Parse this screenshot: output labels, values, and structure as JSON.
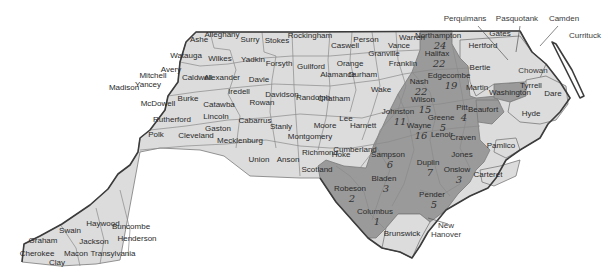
{
  "map": {
    "title": "North Carolina counties",
    "colors": {
      "light_fill": "#dcdcdc",
      "dark_fill": "#9a9a9a",
      "border": "#7a7a7a",
      "state_outline": "#3c3c3c",
      "background": "#ffffff"
    },
    "counties": [
      {
        "name": "Cherokee",
        "x": 37,
        "y": 256,
        "shade": "light"
      },
      {
        "name": "Clay",
        "x": 57,
        "y": 265,
        "shade": "light"
      },
      {
        "name": "Graham",
        "x": 43,
        "y": 243,
        "shade": "light"
      },
      {
        "name": "Swain",
        "x": 70,
        "y": 233,
        "shade": "light"
      },
      {
        "name": "Macon",
        "x": 76,
        "y": 256,
        "shade": "light"
      },
      {
        "name": "Jackson",
        "x": 94,
        "y": 244,
        "shade": "light"
      },
      {
        "name": "Haywood",
        "x": 103,
        "y": 226,
        "shade": "light"
      },
      {
        "name": "Transylvania",
        "x": 113,
        "y": 256,
        "shade": "light"
      },
      {
        "name": "Buncombe",
        "x": 131,
        "y": 229,
        "shade": "light"
      },
      {
        "name": "Henderson",
        "x": 137,
        "y": 241,
        "shade": "light"
      },
      {
        "name": "Madison",
        "x": 124,
        "y": 90,
        "shade": "light"
      },
      {
        "name": "Yancey",
        "x": 148,
        "y": 87,
        "shade": "light"
      },
      {
        "name": "Mitchell",
        "x": 153,
        "y": 78,
        "shade": "light"
      },
      {
        "name": "Avery",
        "x": 171,
        "y": 72,
        "shade": "light"
      },
      {
        "name": "McDowell",
        "x": 158,
        "y": 106,
        "shade": "light"
      },
      {
        "name": "Rutherford",
        "x": 172,
        "y": 122,
        "shade": "light"
      },
      {
        "name": "Polk",
        "x": 156,
        "y": 137,
        "shade": "light"
      },
      {
        "name": "Ashe",
        "x": 199,
        "y": 42,
        "shade": "light"
      },
      {
        "name": "Alleghany",
        "x": 222,
        "y": 37,
        "shade": "light"
      },
      {
        "name": "Watauga",
        "x": 186,
        "y": 58,
        "shade": "light"
      },
      {
        "name": "Caldwell",
        "x": 197,
        "y": 80,
        "shade": "light"
      },
      {
        "name": "Burke",
        "x": 188,
        "y": 101,
        "shade": "light"
      },
      {
        "name": "Cleveland",
        "x": 196,
        "y": 138,
        "shade": "light"
      },
      {
        "name": "Surry",
        "x": 250,
        "y": 42,
        "shade": "light"
      },
      {
        "name": "Wilkes",
        "x": 220,
        "y": 61,
        "shade": "light"
      },
      {
        "name": "Alexander",
        "x": 222,
        "y": 80,
        "shade": "light"
      },
      {
        "name": "Catawba",
        "x": 219,
        "y": 107,
        "shade": "light"
      },
      {
        "name": "Lincoln",
        "x": 216,
        "y": 119,
        "shade": "light"
      },
      {
        "name": "Gaston",
        "x": 218,
        "y": 131,
        "shade": "light"
      },
      {
        "name": "Iredell",
        "x": 239,
        "y": 94,
        "shade": "light"
      },
      {
        "name": "Yadkin",
        "x": 253,
        "y": 62,
        "shade": "light"
      },
      {
        "name": "Davie",
        "x": 259,
        "y": 82,
        "shade": "light"
      },
      {
        "name": "Rowan",
        "x": 262,
        "y": 105,
        "shade": "light"
      },
      {
        "name": "Mecklenburg",
        "x": 240,
        "y": 143,
        "shade": "light"
      },
      {
        "name": "Cabarrus",
        "x": 255,
        "y": 123,
        "shade": "light"
      },
      {
        "name": "Stanly",
        "x": 281,
        "y": 129,
        "shade": "light"
      },
      {
        "name": "Union",
        "x": 259,
        "y": 162,
        "shade": "light"
      },
      {
        "name": "Anson",
        "x": 288,
        "y": 162,
        "shade": "light"
      },
      {
        "name": "Stokes",
        "x": 277,
        "y": 43,
        "shade": "light"
      },
      {
        "name": "Forsyth",
        "x": 279,
        "y": 66,
        "shade": "light"
      },
      {
        "name": "Davidson",
        "x": 282,
        "y": 97,
        "shade": "light"
      },
      {
        "name": "Montgomery",
        "x": 310,
        "y": 139,
        "shade": "light"
      },
      {
        "name": "Richmond",
        "x": 320,
        "y": 155,
        "shade": "light"
      },
      {
        "name": "Rockingham",
        "x": 310,
        "y": 38,
        "shade": "light"
      },
      {
        "name": "Guilford",
        "x": 311,
        "y": 69,
        "shade": "light"
      },
      {
        "name": "Randolph",
        "x": 313,
        "y": 100,
        "shade": "light"
      },
      {
        "name": "Moore",
        "x": 325,
        "y": 128,
        "shade": "light"
      },
      {
        "name": "Caswell",
        "x": 345,
        "y": 48,
        "shade": "light"
      },
      {
        "name": "Alamance",
        "x": 338,
        "y": 77,
        "shade": "light"
      },
      {
        "name": "Person",
        "x": 366,
        "y": 42,
        "shade": "light"
      },
      {
        "name": "Orange",
        "x": 350,
        "y": 66,
        "shade": "light"
      },
      {
        "name": "Durham",
        "x": 363,
        "y": 77,
        "shade": "light"
      },
      {
        "name": "Chatham",
        "x": 334,
        "y": 101,
        "shade": "light"
      },
      {
        "name": "Lee",
        "x": 346,
        "y": 121,
        "shade": "light"
      },
      {
        "name": "Hoke",
        "x": 341,
        "y": 157,
        "shade": "light"
      },
      {
        "name": "Scotland",
        "x": 317,
        "y": 172,
        "shade": "dark"
      },
      {
        "name": "Harnett",
        "x": 363,
        "y": 128,
        "shade": "light"
      },
      {
        "name": "Cumberland",
        "x": 355,
        "y": 152,
        "shade": "light"
      },
      {
        "name": "Wake",
        "x": 381,
        "y": 92,
        "shade": "light"
      },
      {
        "name": "Granville",
        "x": 384,
        "y": 56,
        "shade": "light"
      },
      {
        "name": "Vance",
        "x": 399,
        "y": 48,
        "shade": "light"
      },
      {
        "name": "Warren",
        "x": 412,
        "y": 40,
        "shade": "light"
      },
      {
        "name": "Franklin",
        "x": 403,
        "y": 66,
        "shade": "light"
      },
      {
        "name": "Northampton",
        "x": 438,
        "y": 38,
        "shade": "dark",
        "note": "24"
      },
      {
        "name": "Halifax",
        "x": 437,
        "y": 56,
        "shade": "dark",
        "note": "22"
      },
      {
        "name": "Nash",
        "x": 419,
        "y": 84,
        "shade": "dark",
        "note": "22"
      },
      {
        "name": "Edgecombe",
        "x": 449,
        "y": 78,
        "shade": "dark",
        "note": "19"
      },
      {
        "name": "Johnston",
        "x": 398,
        "y": 114,
        "shade": "dark",
        "note": "11"
      },
      {
        "name": "Wilson",
        "x": 423,
        "y": 102,
        "shade": "dark",
        "note": "15"
      },
      {
        "name": "Wayne",
        "x": 419,
        "y": 128,
        "shade": "dark",
        "note": "16"
      },
      {
        "name": "Greene",
        "x": 441,
        "y": 120,
        "shade": "dark",
        "note": "5"
      },
      {
        "name": "Pitt",
        "x": 462,
        "y": 110,
        "shade": "dark",
        "note": "4"
      },
      {
        "name": "Lenoir",
        "x": 442,
        "y": 137,
        "shade": "dark"
      },
      {
        "name": "Craven",
        "x": 463,
        "y": 140,
        "shade": "dark"
      },
      {
        "name": "Jones",
        "x": 462,
        "y": 157,
        "shade": "dark"
      },
      {
        "name": "Onslow",
        "x": 457,
        "y": 172,
        "shade": "dark",
        "note": "3"
      },
      {
        "name": "Duplin",
        "x": 428,
        "y": 165,
        "shade": "dark",
        "note": "7"
      },
      {
        "name": "Sampson",
        "x": 388,
        "y": 157,
        "shade": "dark",
        "note": "6"
      },
      {
        "name": "Pender",
        "x": 432,
        "y": 197,
        "shade": "dark",
        "note": "5"
      },
      {
        "name": "Bladen",
        "x": 384,
        "y": 181,
        "shade": "dark",
        "note": "3"
      },
      {
        "name": "Robeson",
        "x": 350,
        "y": 191,
        "shade": "dark",
        "note": "2"
      },
      {
        "name": "Columbus",
        "x": 375,
        "y": 214,
        "shade": "dark",
        "note": "1"
      },
      {
        "name": "Brunswick",
        "x": 402,
        "y": 236,
        "shade": "light"
      },
      {
        "name": "Hertford",
        "x": 483,
        "y": 48,
        "shade": "light"
      },
      {
        "name": "Gates",
        "x": 500,
        "y": 36,
        "shade": "light"
      },
      {
        "name": "Bertie",
        "x": 480,
        "y": 70,
        "shade": "light"
      },
      {
        "name": "Martin",
        "x": 477,
        "y": 90,
        "shade": "light"
      },
      {
        "name": "Washington",
        "x": 510,
        "y": 95,
        "shade": "dark"
      },
      {
        "name": "Tyrrell",
        "x": 531,
        "y": 88,
        "shade": "light"
      },
      {
        "name": "Dare",
        "x": 553,
        "y": 96,
        "shade": "light"
      },
      {
        "name": "Beaufort",
        "x": 483,
        "y": 112,
        "shade": "dark"
      },
      {
        "name": "Hyde",
        "x": 531,
        "y": 116,
        "shade": "light"
      },
      {
        "name": "Pamlico",
        "x": 501,
        "y": 148,
        "shade": "light"
      },
      {
        "name": "Carteret",
        "x": 488,
        "y": 177,
        "shade": "light"
      }
    ],
    "external_labels": [
      {
        "name": "Perquimans",
        "x": 465,
        "y": 21
      },
      {
        "name": "Pasquotank",
        "x": 517,
        "y": 21
      },
      {
        "name": "Camden",
        "x": 564,
        "y": 21
      },
      {
        "name": "Currituck",
        "x": 585,
        "y": 38
      },
      {
        "name": "Chowan",
        "x": 533,
        "y": 73
      },
      {
        "name": "New",
        "x": 446,
        "y": 228
      },
      {
        "name": "Hanover",
        "x": 446,
        "y": 237
      }
    ]
  }
}
